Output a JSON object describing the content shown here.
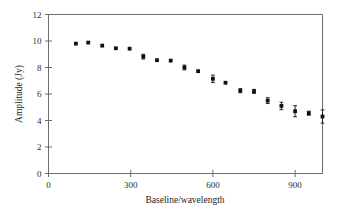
{
  "chart_data": {
    "type": "scatter",
    "title": "",
    "xlabel": "Baseline/wavelength",
    "ylabel": "Amplitude (Jy)",
    "xlim": [
      0,
      1000
    ],
    "ylim": [
      0,
      12
    ],
    "xticks": [
      0,
      300,
      600,
      900
    ],
    "yticks": [
      0,
      2,
      4,
      6,
      8,
      10,
      12
    ],
    "xticklabels": [
      "0",
      "300",
      "600",
      "900"
    ],
    "yticklabels": [
      "0",
      "2",
      "4",
      "6",
      "8",
      "10",
      "12"
    ],
    "grid": false,
    "legend": false,
    "marker": "square",
    "error_bars": "y",
    "series": [
      {
        "name": "Visibility amplitude",
        "x": [
          100,
          145,
          196,
          246,
          296,
          346,
          396,
          446,
          496,
          546,
          600,
          646,
          700,
          750,
          800,
          850,
          900,
          950,
          1000
        ],
        "y": [
          9.8,
          9.88,
          9.65,
          9.45,
          9.42,
          8.82,
          8.55,
          8.52,
          8.0,
          7.72,
          7.15,
          6.85,
          6.25,
          6.2,
          5.5,
          5.1,
          4.7,
          4.55,
          4.3
        ],
        "yerr": [
          0.1,
          0.1,
          0.1,
          0.1,
          0.1,
          0.18,
          0.12,
          0.12,
          0.18,
          0.12,
          0.28,
          0.12,
          0.15,
          0.15,
          0.22,
          0.28,
          0.42,
          0.15,
          0.5
        ]
      }
    ]
  },
  "figure": {
    "frame_color": "#6e6e6e",
    "marker_color": "#111111",
    "background": "#ffffff"
  }
}
